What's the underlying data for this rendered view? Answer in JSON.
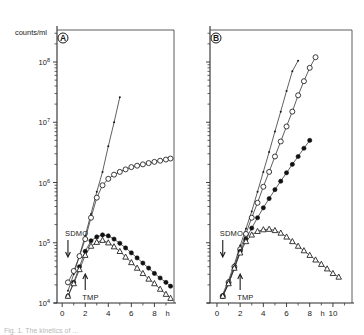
{
  "figure": {
    "ylabel": "counts/ml",
    "caption": "Fig. 1. The kinetics of ...",
    "panels": [
      {
        "letter": "A",
        "xlabel": "h",
        "xticks": [
          "0",
          "2",
          "4",
          "6",
          "8"
        ],
        "annotations": [
          {
            "label": "SDMO",
            "x": 0.5
          },
          {
            "label": "TMP",
            "x": 2.0
          }
        ]
      },
      {
        "letter": "B",
        "xlabel": "h",
        "xticks": [
          "0",
          "2",
          "4",
          "6",
          "8",
          "10"
        ],
        "annotations": [
          {
            "label": "SDMO",
            "x": 0.5
          },
          {
            "label": "TMP",
            "x": 2.0
          }
        ]
      }
    ],
    "yticks": [
      "10",
      "10",
      "10",
      "10",
      "10"
    ],
    "yexponents": [
      "4",
      "5",
      "6",
      "7",
      "8"
    ]
  },
  "chart_data": [
    {
      "type": "line",
      "title": "A",
      "xlabel": "h",
      "ylabel": "counts/ml",
      "yscale": "log",
      "ylim": [
        10000,
        300000000
      ],
      "xlim": [
        -0.4,
        9.6
      ],
      "grid": false,
      "legend": "none",
      "annotations": [
        {
          "text": "SDMO",
          "x": 0.5,
          "y": 150000,
          "arrow": "down"
        },
        {
          "text": "TMP",
          "x": 2.0,
          "y": 14000,
          "arrow": "up"
        }
      ],
      "series": [
        {
          "name": "untreated control (small dots)",
          "marker": "dot",
          "x": [
            0.5,
            1.0,
            1.5,
            2.0,
            2.5,
            3.0,
            3.5,
            4.0,
            4.5,
            5.0
          ],
          "y": [
            16000,
            30000,
            62000,
            130000,
            300000,
            700000,
            1500000,
            4000000,
            10000000,
            26000000
          ]
        },
        {
          "name": "open circles",
          "marker": "open-circle",
          "x": [
            0.5,
            1.0,
            1.5,
            2.0,
            2.5,
            3.0,
            3.5,
            4.0,
            4.5,
            5.0,
            5.5,
            6.0,
            6.5,
            7.0,
            7.5,
            8.0,
            8.5,
            9.0,
            9.4
          ],
          "y": [
            22000,
            34000,
            60000,
            115000,
            260000,
            560000,
            900000,
            1150000,
            1350000,
            1500000,
            1650000,
            1800000,
            1900000,
            2000000,
            2100000,
            2200000,
            2300000,
            2400000,
            2500000
          ]
        },
        {
          "name": "filled circles",
          "marker": "filled-circle",
          "x": [
            0.5,
            1.0,
            1.5,
            2.0,
            2.5,
            3.0,
            3.5,
            4.0,
            4.5,
            5.0,
            5.5,
            6.0,
            6.5,
            7.0,
            7.5,
            8.0,
            8.5,
            9.0,
            9.4
          ],
          "y": [
            13000,
            22000,
            40000,
            72000,
            108000,
            125000,
            135000,
            130000,
            115000,
            98000,
            82000,
            68000,
            56000,
            46000,
            38000,
            31000,
            26000,
            22000,
            19000
          ]
        },
        {
          "name": "open triangles",
          "marker": "open-triangle",
          "x": [
            0.5,
            1.0,
            1.5,
            2.0,
            2.5,
            3.0,
            3.5,
            4.0,
            4.5,
            5.0,
            5.5,
            6.0,
            6.5,
            7.0,
            7.5,
            8.0,
            8.5,
            9.0,
            9.4
          ],
          "y": [
            13000,
            21000,
            36000,
            62000,
            88000,
            102000,
            110000,
            100000,
            86000,
            72000,
            58000,
            47000,
            38000,
            31000,
            25000,
            21000,
            17000,
            14000,
            12000
          ]
        }
      ]
    },
    {
      "type": "line",
      "title": "B",
      "xlabel": "h",
      "ylabel": "counts/ml",
      "yscale": "log",
      "ylim": [
        10000,
        300000000
      ],
      "xlim": [
        -0.6,
        11.2
      ],
      "grid": false,
      "legend": "none",
      "annotations": [
        {
          "text": "SDMO",
          "x": 0.5,
          "y": 150000,
          "arrow": "down"
        },
        {
          "text": "TMP",
          "x": 2.0,
          "y": 14000,
          "arrow": "up"
        }
      ],
      "series": [
        {
          "name": "untreated control (small dots)",
          "marker": "dot",
          "x": [
            0.5,
            1.0,
            1.5,
            2.0,
            2.5,
            3.0,
            3.5,
            4.0,
            4.5,
            5.0,
            5.5,
            6.0,
            6.5,
            7.0
          ],
          "y": [
            14000,
            24000,
            44000,
            90000,
            170000,
            330000,
            700000,
            1500000,
            3200000,
            7000000,
            15000000,
            33000000,
            70000000,
            105000000
          ]
        },
        {
          "name": "open circles",
          "marker": "open-circle",
          "x": [
            0.5,
            1.0,
            1.5,
            2.0,
            2.5,
            3.0,
            3.5,
            4.0,
            4.5,
            5.0,
            5.5,
            6.0,
            6.5,
            7.0,
            7.5,
            8.0,
            8.5
          ],
          "y": [
            13000,
            22000,
            40000,
            78000,
            140000,
            260000,
            460000,
            850000,
            1500000,
            2700000,
            4800000,
            8500000,
            15000000,
            28000000,
            48000000,
            80000000,
            120000000
          ]
        },
        {
          "name": "filled circles",
          "marker": "filled-circle",
          "x": [
            0.5,
            1.0,
            1.5,
            2.0,
            2.5,
            3.0,
            3.5,
            4.0,
            4.5,
            5.0,
            5.5,
            6.0,
            6.5,
            7.0,
            7.5,
            8.0
          ],
          "y": [
            13000,
            21000,
            38000,
            72000,
            115000,
            175000,
            260000,
            380000,
            540000,
            760000,
            1050000,
            1450000,
            2000000,
            2700000,
            3700000,
            5000000
          ]
        },
        {
          "name": "open triangles",
          "marker": "open-triangle",
          "x": [
            0.5,
            1.0,
            1.5,
            2.0,
            2.5,
            3.0,
            3.5,
            4.0,
            4.5,
            5.0,
            5.5,
            6.0,
            6.5,
            7.0,
            7.5,
            8.0,
            8.5,
            9.0,
            9.5,
            10.0,
            10.5
          ],
          "y": [
            13000,
            21000,
            38000,
            68000,
            105000,
            135000,
            155000,
            165000,
            168000,
            160000,
            145000,
            125000,
            105000,
            88000,
            74000,
            62000,
            52000,
            44000,
            37000,
            31000,
            27000
          ]
        }
      ]
    }
  ]
}
